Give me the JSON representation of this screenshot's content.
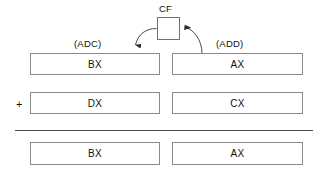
{
  "diagram": {
    "flag": {
      "label": "CF",
      "name": "carry-flag"
    },
    "operations": {
      "left": "(ADC)",
      "right": "(ADD)"
    },
    "operator": "+",
    "rows": [
      {
        "name": "operand-high-low-row",
        "left": "BX",
        "right": "AX"
      },
      {
        "name": "addend-row",
        "left": "DX",
        "right": "CX"
      },
      {
        "name": "result-row",
        "left": "BX",
        "right": "AX"
      }
    ],
    "colors": {
      "box_border": "#8a8a8a",
      "flag_border": "#6f6f6f",
      "line": "#4a4a4a",
      "text": "#111111",
      "background": "#ffffff"
    }
  }
}
